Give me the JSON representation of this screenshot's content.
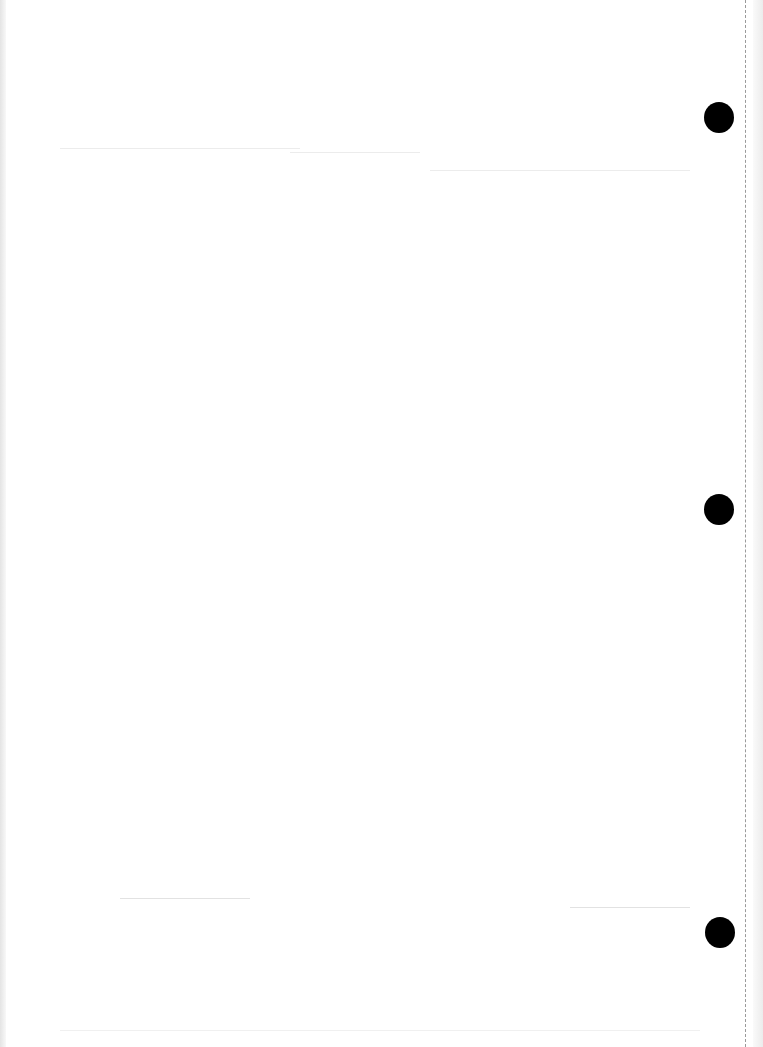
{
  "document": {
    "type": "blank scanned page",
    "text": "",
    "punch_holes": [
      {
        "x": 704,
        "y": 117
      },
      {
        "x": 704,
        "y": 509
      },
      {
        "x": 704,
        "y": 917
      }
    ],
    "colors": {
      "paper": "#ffffff",
      "punch_hole": "#000000",
      "edge_shadow": "#e4e4e4",
      "dashed_line": "#9a9a9a"
    }
  }
}
